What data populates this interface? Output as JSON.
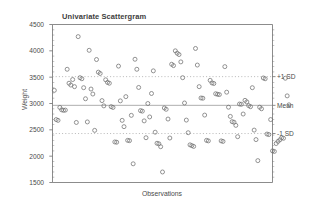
{
  "chart_data": {
    "type": "scatter",
    "title": "Univariate Scattergram",
    "xlabel": "Observations",
    "ylabel": "Weight",
    "ylim": [
      1500,
      4500
    ],
    "xlim": [
      0,
      120
    ],
    "ytick_labels": [
      "4500",
      "4000",
      "3500",
      "3000",
      "2500",
      "2000",
      "1500"
    ],
    "ytick_values": [
      4500,
      4000,
      3500,
      3000,
      2500,
      2000,
      1500
    ],
    "grid": false,
    "legend": "none",
    "reference_lines": [
      {
        "name": "+1 SD",
        "label": "+1 SD",
        "value": 3510,
        "style": "dotted"
      },
      {
        "name": "Mean",
        "label": "Mean",
        "value": 2965,
        "style": "solid"
      },
      {
        "name": "-1 SD",
        "label": "-1 SD",
        "value": 2430,
        "style": "dotted"
      }
    ],
    "marker": "open-circle",
    "marker_color": "#6a6a6a",
    "points": [
      {
        "x": 1,
        "y": 3250
      },
      {
        "x": 2,
        "y": 2695
      },
      {
        "x": 3,
        "y": 2680
      },
      {
        "x": 4,
        "y": 2925
      },
      {
        "x": 5,
        "y": 2880
      },
      {
        "x": 6,
        "y": 2870
      },
      {
        "x": 7,
        "y": 2875
      },
      {
        "x": 8,
        "y": 3650
      },
      {
        "x": 9,
        "y": 3385
      },
      {
        "x": 10,
        "y": 3350
      },
      {
        "x": 11,
        "y": 3455
      },
      {
        "x": 12,
        "y": 3320
      },
      {
        "x": 13,
        "y": 2640
      },
      {
        "x": 14,
        "y": 4270
      },
      {
        "x": 15,
        "y": 3490
      },
      {
        "x": 16,
        "y": 3470
      },
      {
        "x": 17,
        "y": 3300
      },
      {
        "x": 18,
        "y": 3090
      },
      {
        "x": 19,
        "y": 2650
      },
      {
        "x": 20,
        "y": 4010
      },
      {
        "x": 21,
        "y": 3275
      },
      {
        "x": 22,
        "y": 3180
      },
      {
        "x": 23,
        "y": 2490
      },
      {
        "x": 24,
        "y": 3835
      },
      {
        "x": 25,
        "y": 3595
      },
      {
        "x": 26,
        "y": 3570
      },
      {
        "x": 27,
        "y": 3055
      },
      {
        "x": 28,
        "y": 2955
      },
      {
        "x": 29,
        "y": 3450
      },
      {
        "x": 30,
        "y": 3400
      },
      {
        "x": 31,
        "y": 3385
      },
      {
        "x": 32,
        "y": 2940
      },
      {
        "x": 33,
        "y": 2925
      },
      {
        "x": 34,
        "y": 2270
      },
      {
        "x": 35,
        "y": 2265
      },
      {
        "x": 36,
        "y": 3710
      },
      {
        "x": 37,
        "y": 3050
      },
      {
        "x": 38,
        "y": 2680
      },
      {
        "x": 39,
        "y": 2560
      },
      {
        "x": 40,
        "y": 3130
      },
      {
        "x": 41,
        "y": 2300
      },
      {
        "x": 42,
        "y": 2295
      },
      {
        "x": 43,
        "y": 2775
      },
      {
        "x": 44,
        "y": 1855
      },
      {
        "x": 45,
        "y": 3840
      },
      {
        "x": 46,
        "y": 3650
      },
      {
        "x": 47,
        "y": 3305
      },
      {
        "x": 48,
        "y": 2865
      },
      {
        "x": 49,
        "y": 2855
      },
      {
        "x": 50,
        "y": 2670
      },
      {
        "x": 51,
        "y": 2350
      },
      {
        "x": 52,
        "y": 3000
      },
      {
        "x": 53,
        "y": 2745
      },
      {
        "x": 54,
        "y": 3190
      },
      {
        "x": 55,
        "y": 3620
      },
      {
        "x": 56,
        "y": 2455
      },
      {
        "x": 57,
        "y": 2245
      },
      {
        "x": 58,
        "y": 2235
      },
      {
        "x": 59,
        "y": 2180
      },
      {
        "x": 60,
        "y": 1700
      },
      {
        "x": 61,
        "y": 2915
      },
      {
        "x": 62,
        "y": 2890
      },
      {
        "x": 63,
        "y": 2705
      },
      {
        "x": 64,
        "y": 2345
      },
      {
        "x": 65,
        "y": 3745
      },
      {
        "x": 66,
        "y": 3720
      },
      {
        "x": 67,
        "y": 4000
      },
      {
        "x": 68,
        "y": 3955
      },
      {
        "x": 69,
        "y": 3930
      },
      {
        "x": 70,
        "y": 3790
      },
      {
        "x": 71,
        "y": 3490
      },
      {
        "x": 72,
        "y": 3010
      },
      {
        "x": 73,
        "y": 2685
      },
      {
        "x": 74,
        "y": 2445
      },
      {
        "x": 75,
        "y": 2215
      },
      {
        "x": 76,
        "y": 2200
      },
      {
        "x": 77,
        "y": 2185
      },
      {
        "x": 78,
        "y": 4045
      },
      {
        "x": 79,
        "y": 3730
      },
      {
        "x": 80,
        "y": 3320
      },
      {
        "x": 81,
        "y": 3105
      },
      {
        "x": 82,
        "y": 3100
      },
      {
        "x": 83,
        "y": 2780
      },
      {
        "x": 84,
        "y": 2300
      },
      {
        "x": 85,
        "y": 2290
      },
      {
        "x": 86,
        "y": 3440
      },
      {
        "x": 87,
        "y": 3390
      },
      {
        "x": 88,
        "y": 3380
      },
      {
        "x": 89,
        "y": 3185
      },
      {
        "x": 90,
        "y": 3175
      },
      {
        "x": 91,
        "y": 3170
      },
      {
        "x": 92,
        "y": 2290
      },
      {
        "x": 93,
        "y": 2280
      },
      {
        "x": 94,
        "y": 3700
      },
      {
        "x": 95,
        "y": 3215
      },
      {
        "x": 96,
        "y": 2930
      },
      {
        "x": 97,
        "y": 2755
      },
      {
        "x": 98,
        "y": 2655
      },
      {
        "x": 99,
        "y": 2645
      },
      {
        "x": 100,
        "y": 2585
      },
      {
        "x": 101,
        "y": 2370
      },
      {
        "x": 102,
        "y": 2990
      },
      {
        "x": 103,
        "y": 2985
      },
      {
        "x": 104,
        "y": 2800
      },
      {
        "x": 105,
        "y": 3060
      },
      {
        "x": 106,
        "y": 3030
      },
      {
        "x": 107,
        "y": 2960
      },
      {
        "x": 108,
        "y": 2940
      },
      {
        "x": 109,
        "y": 3300
      },
      {
        "x": 110,
        "y": 2495
      },
      {
        "x": 111,
        "y": 2315
      },
      {
        "x": 112,
        "y": 1915
      },
      {
        "x": 113,
        "y": 2930
      },
      {
        "x": 114,
        "y": 2900
      },
      {
        "x": 115,
        "y": 3485
      },
      {
        "x": 116,
        "y": 3470
      },
      {
        "x": 117,
        "y": 2420
      },
      {
        "x": 118,
        "y": 2410
      },
      {
        "x": 119,
        "y": 2695
      },
      {
        "x": 120,
        "y": 2100
      },
      {
        "x": 121,
        "y": 2090
      },
      {
        "x": 122,
        "y": 2240
      },
      {
        "x": 123,
        "y": 2280
      },
      {
        "x": 124,
        "y": 2310
      },
      {
        "x": 125,
        "y": 2350
      },
      {
        "x": 126,
        "y": 2340
      },
      {
        "x": 127,
        "y": 3480
      },
      {
        "x": 128,
        "y": 3145
      },
      {
        "x": 129,
        "y": 2975
      }
    ]
  },
  "colors": {
    "axis": "#6e6e6e",
    "marker": "#707070",
    "reference_dotted": "#9a9a9a",
    "reference_solid": "#8d8d8d",
    "text": "#444444",
    "background": "#ffffff"
  }
}
